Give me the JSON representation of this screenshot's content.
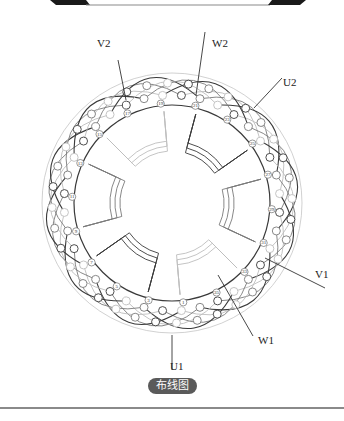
{
  "figure": {
    "caption": "布线图",
    "terminals": [
      {
        "id": "V2",
        "label": "V2",
        "x": 97,
        "y": 47,
        "lead": [
          [
            118,
            60
          ],
          [
            126,
            100
          ]
        ]
      },
      {
        "id": "W2",
        "label": "W2",
        "x": 212,
        "y": 47,
        "lead": [
          [
            205,
            32
          ],
          [
            196,
            95
          ]
        ]
      },
      {
        "id": "U2",
        "label": "U2",
        "x": 283,
        "y": 86,
        "lead": [
          [
            282,
            78
          ],
          [
            254,
            108
          ]
        ]
      },
      {
        "id": "V1",
        "label": "V1",
        "x": 315,
        "y": 278,
        "lead": [
          [
            325,
            288
          ],
          [
            265,
            258
          ]
        ]
      },
      {
        "id": "W1",
        "label": "W1",
        "x": 258,
        "y": 344,
        "lead": [
          [
            253,
            336
          ],
          [
            218,
            275
          ]
        ]
      },
      {
        "id": "U1",
        "label": "U1",
        "x": 170,
        "y": 370,
        "lead": [
          [
            172,
            370
          ],
          [
            172,
            335
          ]
        ]
      }
    ],
    "slot_numbers": [
      "1",
      "3",
      "5",
      "7",
      "9",
      "11",
      "13",
      "15",
      "17",
      "19",
      "21",
      "23",
      "25",
      "27",
      "29",
      "31",
      "33",
      "35"
    ],
    "slot_count": 36,
    "colors": {
      "phase_dark": "#3a3a3a",
      "phase_mid": "#7a7a7a",
      "phase_light": "#bdbdbd",
      "caption_bg": "#5a5a5a",
      "banner": "#1a1a1a"
    }
  }
}
